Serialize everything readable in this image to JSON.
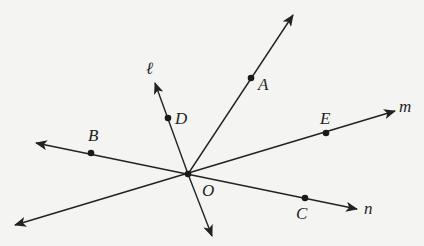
{
  "diagram": {
    "center": {
      "name": "O",
      "x": 188,
      "y": 174
    },
    "colors": {
      "background": "#f4f4f2",
      "stroke": "#222222"
    },
    "lines": [
      {
        "id": "ray-OA",
        "from": [
          188,
          174
        ],
        "to": [
          293,
          15
        ],
        "arrow_end": true
      },
      {
        "id": "ray-l",
        "name": "ℓ",
        "from": [
          188,
          174
        ],
        "to": [
          155,
          83
        ],
        "arrow_end": true
      },
      {
        "id": "ray-down",
        "from": [
          188,
          174
        ],
        "to": [
          212,
          236
        ],
        "arrow_end": true
      },
      {
        "id": "line-m",
        "name": "m",
        "from": [
          15,
          225
        ],
        "to": [
          395,
          111
        ],
        "arrow_start": true,
        "arrow_end": true
      },
      {
        "id": "line-n",
        "name": "n",
        "from": [
          36,
          143
        ],
        "to": [
          357,
          209
        ],
        "arrow_start": true,
        "arrow_end": true
      }
    ],
    "points": [
      {
        "name": "A",
        "x": 251,
        "y": 78
      },
      {
        "name": "B",
        "x": 91,
        "y": 153
      },
      {
        "name": "C",
        "x": 305,
        "y": 198
      },
      {
        "name": "D",
        "x": 168,
        "y": 118
      },
      {
        "name": "E",
        "x": 326,
        "y": 133
      },
      {
        "name": "O",
        "x": 188,
        "y": 174
      }
    ],
    "labels": {
      "A": "A",
      "B": "B",
      "C": "C",
      "D": "D",
      "E": "E",
      "O": "O",
      "l": "ℓ",
      "m": "m",
      "n": "n"
    }
  }
}
